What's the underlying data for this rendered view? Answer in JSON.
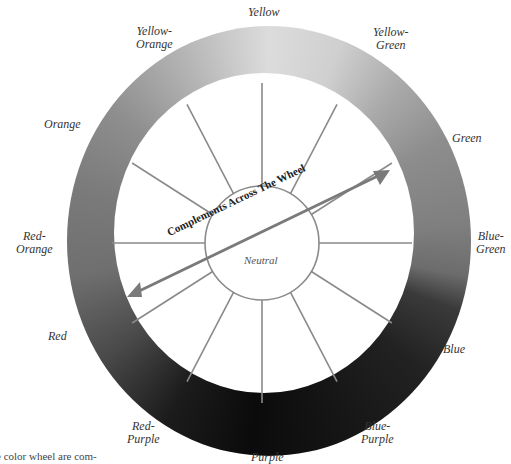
{
  "diagram": {
    "center_label": "Neutral",
    "arrow_label": "Complements Across The Wheel",
    "spoke_count": 12,
    "hues": [
      {
        "name": "yellow",
        "label": "Yellow"
      },
      {
        "name": "yellow-green",
        "label": "Yellow-\nGreen"
      },
      {
        "name": "green",
        "label": "Green"
      },
      {
        "name": "blue-green",
        "label": "Blue-\nGreen"
      },
      {
        "name": "blue",
        "label": "Blue"
      },
      {
        "name": "blue-purple",
        "label": "Blue-\nPurple"
      },
      {
        "name": "purple",
        "label": "Purple"
      },
      {
        "name": "red-purple",
        "label": "Red-\nPurple"
      },
      {
        "name": "red",
        "label": "Red"
      },
      {
        "name": "red-orange",
        "label": "Red-\nOrange"
      },
      {
        "name": "orange",
        "label": "Orange"
      },
      {
        "name": "yellow-orange",
        "label": "Yellow-\nOrange"
      }
    ],
    "caption_fragment": "e color wheel are com-"
  },
  "colors": {
    "spoke": "#8a8a8a",
    "arrow": "#7a7a7a"
  }
}
